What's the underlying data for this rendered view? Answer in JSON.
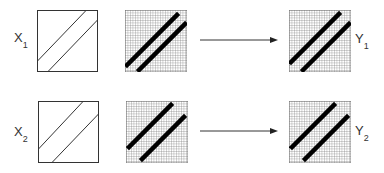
{
  "diagram": {
    "rows": [
      {
        "input_label": "X",
        "input_subscript": "1",
        "output_label": "Y",
        "output_subscript": "1",
        "band_offset": "upper-left diagonal pair"
      },
      {
        "input_label": "X",
        "input_subscript": "2",
        "output_label": "Y",
        "output_subscript": "2",
        "band_offset": "shifted diagonal pair"
      }
    ],
    "elements": [
      "continuous-input-box",
      "discretized-grid",
      "arrow",
      "output-grid"
    ],
    "colors": {
      "line": "#333333",
      "grid": "#777777",
      "band": "#000000",
      "background": "#ffffff"
    }
  }
}
